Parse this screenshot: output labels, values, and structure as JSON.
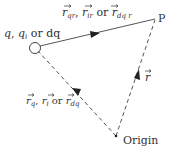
{
  "diagram": {
    "source_label": {
      "q": "q",
      "sep1": ", ",
      "qi": "q",
      "qi_sub": "i",
      "or": " or ",
      "dq": "dq"
    },
    "top_vector_label": {
      "r1": "r",
      "r1_sub": "qr",
      "sep1": ", ",
      "r2": "r",
      "r2_sub": "ir",
      "or": " or ",
      "r3": "r",
      "r3_sub": "dq r"
    },
    "point_label": "P",
    "left_vector_label": {
      "r1": "r",
      "r1_sub": "q",
      "sep1": ", ",
      "r2": "r",
      "r2_sub": "i",
      "or": " or ",
      "r3": "r",
      "r3_sub": "dq"
    },
    "right_vector_label": "r",
    "origin_label": "Origin",
    "colors": {
      "line": "#555555",
      "arrow": "#222222",
      "text": "#333333"
    }
  }
}
